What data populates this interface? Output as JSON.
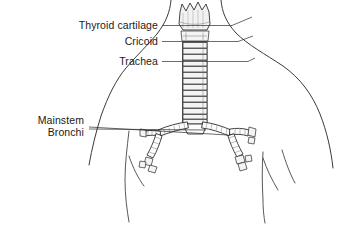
{
  "figure": {
    "background_color": "#ffffff",
    "line_color": "#2b2b2b",
    "labels": [
      {
        "id": "thyroid-cartilage",
        "text": "Thyroid cartilage",
        "text_x": 158,
        "text_y": 29,
        "leader": "M 162 25.5 L 232 25.5 L 252 17",
        "align": "end"
      },
      {
        "id": "cricoid",
        "text": "Cricoid",
        "text_x": 158,
        "text_y": 45,
        "leader": "M 162 41.5 L 238 41.5 L 253 36",
        "align": "end"
      },
      {
        "id": "trachea",
        "text": "Trachea",
        "text_x": 158,
        "text_y": 65,
        "leader": "M 162 61.5 L 248 61.5 L 255 58",
        "align": "end"
      },
      {
        "id": "mainstem-bronchi-line1",
        "text": "Mainstem",
        "text_x": 84,
        "text_y": 124,
        "leader": "M 89 127 L 228 135",
        "align": "end"
      },
      {
        "id": "mainstem-bronchi-line2",
        "text": "Bronchi",
        "text_x": 84,
        "text_y": 136,
        "leader": "M 89 129 L 206 130",
        "align": "end"
      }
    ],
    "anatomy": {
      "structures": [
        "thyroid cartilage",
        "cricoid cartilage",
        "trachea",
        "carina",
        "right mainstem bronchus",
        "left mainstem bronchus",
        "segmental bronchi"
      ],
      "trachea_ring_count": 14,
      "torso_outline": true
    }
  }
}
